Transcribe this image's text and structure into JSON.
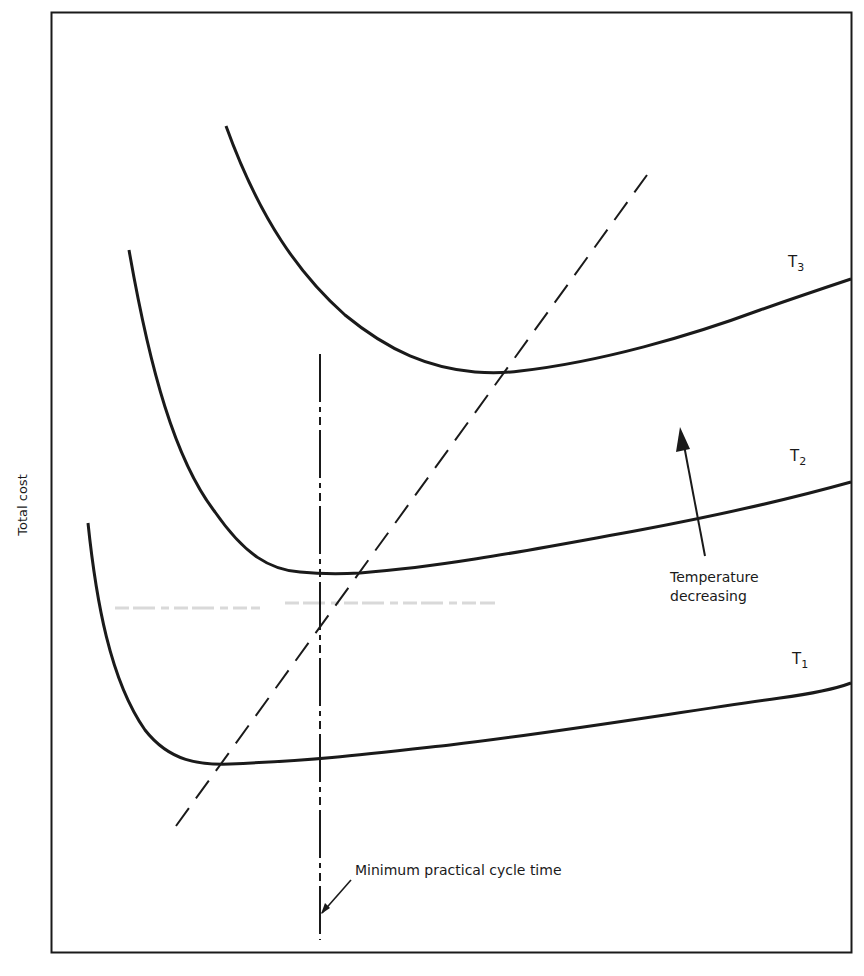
{
  "figure": {
    "y_axis_label": "Total cost",
    "x_axis_label": "",
    "curves": [
      {
        "name": "T1",
        "base": "T",
        "sub": "1",
        "label_x": 792,
        "label_y": 650,
        "path": "M88,523 C96,600 110,680 145,730 C170,762 200,765 230,764 C320,760 360,755 450,745 C560,732 680,712 780,698 C810,694 835,689 851,683"
      },
      {
        "name": "T2",
        "base": "T",
        "sub": "2",
        "label_x": 790,
        "label_y": 447,
        "path": "M129,250 C150,370 175,460 215,512 C245,555 270,570 300,572 C320,574 340,574 360,573 C450,566 540,548 640,530 C720,515 790,499 851,482"
      },
      {
        "name": "T3",
        "base": "T",
        "sub": "3",
        "label_x": 788,
        "label_y": 253,
        "path": "M226,126 C260,220 300,275 345,315 C390,352 430,368 475,372 C490,373 505,373 520,371 C600,362 690,336 760,310 C800,296 830,286 851,279"
      }
    ],
    "annotations": {
      "temperature_arrow_label_line1": "Temperature",
      "temperature_arrow_label_line2": "decreasing",
      "min_cycle_label": "Minimum practical cycle time"
    },
    "colors": {
      "ink": "#1a1a1a",
      "smudge": "#d6d6d6",
      "background": "#ffffff"
    }
  }
}
